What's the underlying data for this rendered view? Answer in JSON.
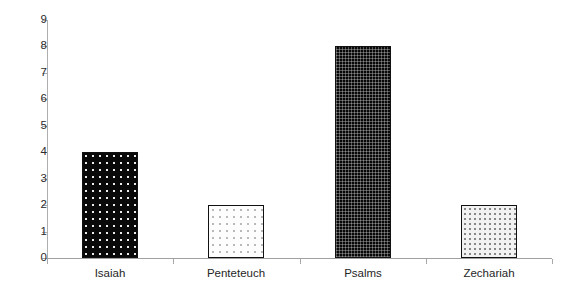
{
  "chart_data": {
    "type": "bar",
    "title": "",
    "subtitle": "",
    "xlabel": "",
    "ylabel": "",
    "categories": [
      "Isaiah",
      "Penteteuch",
      "Psalms",
      "Zechariah"
    ],
    "values": [
      4,
      2,
      8,
      2
    ],
    "ylim": [
      0,
      9
    ],
    "ytick_labels": [
      "0",
      "1",
      "2",
      "3",
      "4",
      "5",
      "6",
      "7",
      "8",
      "9"
    ],
    "ytick_values": [
      0,
      1,
      2,
      3,
      4,
      5,
      6,
      7,
      8,
      9
    ],
    "grid": false,
    "legend": false,
    "legend_position": "none",
    "annotations": [],
    "bar_styles": [
      {
        "category": "Isaiah",
        "fill": "black-dotted",
        "fill_color": "#090909",
        "border_color": "#111111"
      },
      {
        "category": "Penteteuch",
        "fill": "white-dotted",
        "fill_color": "#fdfdfd",
        "border_color": "#111111"
      },
      {
        "category": "Psalms",
        "fill": "black-checkered",
        "fill_color": "#080808",
        "border_color": "#111111"
      },
      {
        "category": "Zechariah",
        "fill": "lightgray-dotted",
        "fill_color": "#f2f2f2",
        "border_color": "#111111"
      }
    ]
  },
  "axes": {
    "y_axis_color": "#aeaeae",
    "x_axis_color": "#a0a0a0",
    "tick_color": "#a8a8a8",
    "label_color": "#262626"
  },
  "background": "#ffffff"
}
